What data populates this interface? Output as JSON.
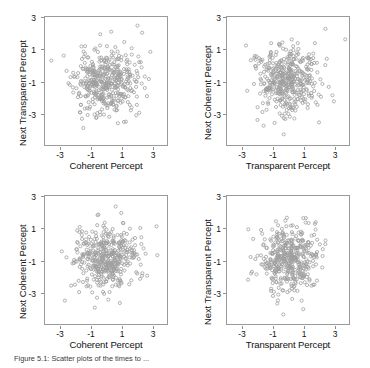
{
  "figure": {
    "caption": "Figure 5.1: Scatter plots of the times to ...",
    "axis_color": "#9a9a9a",
    "marker_color": "#9e9e9e",
    "background": "#ffffff"
  },
  "chart_data": [
    {
      "id": "panel-top-left",
      "type": "scatter",
      "title": "",
      "xlabel": "Coherent Percept",
      "ylabel": "Next Transparent Percept",
      "xticks": [
        "-3",
        "-1",
        "1",
        "3"
      ],
      "yticks": [
        "3",
        "1",
        "-1",
        "-3"
      ],
      "xtick_values": [
        -3,
        -1,
        1,
        3
      ],
      "ytick_values": [
        3,
        1,
        -1,
        -3
      ],
      "xlim": [
        -4,
        4
      ],
      "ylim": [
        -4,
        4
      ],
      "grid": false,
      "legend": "none",
      "n_points": 430,
      "marker": "open-circle",
      "marker_size": 1.6,
      "seed": 11,
      "mean_x": -0.05,
      "mean_y": -0.05,
      "sd_x": 1.02,
      "sd_y": 1.0,
      "correlation": 0.03
    },
    {
      "id": "panel-top-right",
      "type": "scatter",
      "title": "",
      "xlabel": "Transparent Percept",
      "ylabel": "Next Coherent Percept",
      "xticks": [
        "-3",
        "-1",
        "1",
        "3"
      ],
      "yticks": [
        "3",
        "1",
        "-1",
        "-3"
      ],
      "xtick_values": [
        -3,
        -1,
        1,
        3
      ],
      "ytick_values": [
        3,
        1,
        -1,
        -3
      ],
      "xlim": [
        -4,
        4
      ],
      "ylim": [
        -4,
        4
      ],
      "grid": false,
      "legend": "none",
      "n_points": 430,
      "marker": "open-circle",
      "marker_size": 1.6,
      "seed": 27,
      "mean_x": -0.02,
      "mean_y": 0.0,
      "sd_x": 1.05,
      "sd_y": 1.03,
      "correlation": 0.02
    },
    {
      "id": "panel-bottom-left",
      "type": "scatter",
      "title": "",
      "xlabel": "Coherent Percept",
      "ylabel": "Next Coherent Percept",
      "xticks": [
        "-3",
        "-1",
        "1",
        "3"
      ],
      "yticks": [
        "3",
        "1",
        "-1",
        "-3"
      ],
      "xtick_values": [
        -3,
        -1,
        1,
        3
      ],
      "ytick_values": [
        3,
        1,
        -1,
        -3
      ],
      "xlim": [
        -4,
        4
      ],
      "ylim": [
        -4,
        4
      ],
      "grid": false,
      "legend": "none",
      "n_points": 430,
      "marker": "open-circle",
      "marker_size": 1.6,
      "seed": 43,
      "mean_x": 0.0,
      "mean_y": -0.02,
      "sd_x": 1.0,
      "sd_y": 1.02,
      "correlation": 0.05
    },
    {
      "id": "panel-bottom-right",
      "type": "scatter",
      "title": "",
      "xlabel": "Transparent Percept",
      "ylabel": "Next Transparent Percept",
      "xticks": [
        "-3",
        "-1",
        "1",
        "3"
      ],
      "yticks": [
        "3",
        "1",
        "-1",
        "-3"
      ],
      "xtick_values": [
        -3,
        -1,
        1,
        3
      ],
      "ytick_values": [
        3,
        1,
        -1,
        -3
      ],
      "xlim": [
        -4,
        4
      ],
      "ylim": [
        -4,
        4
      ],
      "grid": false,
      "legend": "none",
      "n_points": 430,
      "marker": "open-circle",
      "marker_size": 1.6,
      "seed": 61,
      "mean_x": 0.02,
      "mean_y": 0.0,
      "sd_x": 1.0,
      "sd_y": 1.0,
      "correlation": 0.04
    }
  ],
  "panels": {
    "top_left": {
      "xlabel": "Coherent Percept",
      "ylabel": "Next Transparent Percept",
      "xt0": "-3",
      "xt1": "-1",
      "xt2": "1",
      "xt3": "3",
      "yt0": "3",
      "yt1": "1",
      "yt2": "-1",
      "yt3": "-3"
    },
    "top_right": {
      "xlabel": "Transparent Percept",
      "ylabel": "Next Coherent Percept",
      "xt0": "-3",
      "xt1": "-1",
      "xt2": "1",
      "xt3": "3",
      "yt0": "3",
      "yt1": "1",
      "yt2": "-1",
      "yt3": "-3"
    },
    "bottom_left": {
      "xlabel": "Coherent Percept",
      "ylabel": "Next Coherent Percept",
      "xt0": "-3",
      "xt1": "-1",
      "xt2": "1",
      "xt3": "3",
      "yt0": "3",
      "yt1": "1",
      "yt2": "-1",
      "yt3": "-3"
    },
    "bottom_right": {
      "xlabel": "Transparent Percept",
      "ylabel": "Next Transparent Percept",
      "xt0": "-3",
      "xt1": "-1",
      "xt2": "1",
      "xt3": "3",
      "yt0": "3",
      "yt1": "1",
      "yt2": "-1",
      "yt3": "-3"
    }
  }
}
